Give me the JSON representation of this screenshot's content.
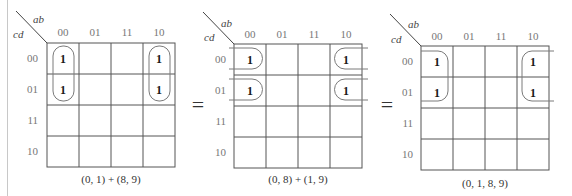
{
  "row_var": "cd",
  "col_var": "ab",
  "col_labels": [
    "00",
    "01",
    "11",
    "10"
  ],
  "row_labels": [
    "00",
    "01",
    "11",
    "10"
  ],
  "equals_sign": "=",
  "maps": [
    {
      "id": "map-1",
      "caption": "(0, 1) + (8, 9)",
      "origin": [
        47,
        43
      ],
      "cell_w": 32,
      "cell_h": 31,
      "cells": [
        [
          "1",
          "",
          "",
          "1"
        ],
        [
          "1",
          "",
          "",
          "1"
        ],
        [
          "",
          "",
          "",
          ""
        ],
        [
          "",
          "",
          "",
          ""
        ]
      ],
      "groups": [
        "(0, 1)",
        "(8, 9)"
      ]
    },
    {
      "id": "map-2",
      "caption": "(0, 8) + (1, 9)",
      "origin": [
        234,
        44
      ],
      "cell_w": 32,
      "cell_h": 31,
      "cells": [
        [
          "1",
          "",
          "",
          "1"
        ],
        [
          "1",
          "",
          "",
          "1"
        ],
        [
          "",
          "",
          "",
          ""
        ],
        [
          "",
          "",
          "",
          ""
        ]
      ],
      "groups": [
        "(0, 8)",
        "(1, 9)"
      ]
    },
    {
      "id": "map-3",
      "caption": "(0, 1, 8, 9)",
      "origin": [
        421,
        46
      ],
      "cell_w": 32,
      "cell_h": 31,
      "cells": [
        [
          "1",
          "",
          "",
          "1"
        ],
        [
          "1",
          "",
          "",
          "1"
        ],
        [
          "",
          "",
          "",
          ""
        ],
        [
          "",
          "",
          "",
          ""
        ]
      ],
      "groups": [
        "(0, 1, 8, 9)"
      ]
    }
  ],
  "colors": {
    "grid": "#555555",
    "loop": "#7a7a7a",
    "header_text": "#777777",
    "ones": "#1a1a1a"
  }
}
